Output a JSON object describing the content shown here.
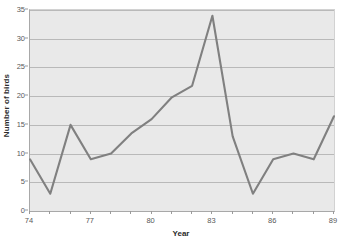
{
  "chart_data": {
    "type": "line",
    "title": "",
    "xlabel": "Year",
    "ylabel": "Number of birds",
    "x": [
      74,
      75,
      76,
      77,
      78,
      79,
      80,
      81,
      82,
      83,
      84,
      85,
      86,
      87,
      88,
      89
    ],
    "values": [
      9,
      3,
      15,
      9,
      10,
      13.5,
      16,
      19.8,
      21.8,
      34,
      13,
      3,
      9,
      10,
      9,
      16.5
    ],
    "series": [
      {
        "name": "Number of birds",
        "values": [
          9,
          3,
          15,
          9,
          10,
          13.5,
          16,
          19.8,
          21.8,
          34,
          13,
          3,
          9,
          10,
          9,
          16.5
        ]
      }
    ],
    "xlim": [
      74,
      89
    ],
    "ylim": [
      0,
      35
    ],
    "ytick_values": [
      0,
      5,
      10,
      15,
      20,
      25,
      30,
      35
    ],
    "ytick_labels": [
      "0",
      "5",
      "10",
      "15",
      "20",
      "25",
      "30",
      "35"
    ],
    "xtick_values": [
      74,
      75,
      76,
      77,
      78,
      79,
      80,
      81,
      82,
      83,
      84,
      85,
      86,
      87,
      88,
      89
    ],
    "xtick_labels_shown": [
      {
        "value": 74,
        "label": "74"
      },
      {
        "value": 77,
        "label": "77"
      },
      {
        "value": 80,
        "label": "80"
      },
      {
        "value": 83,
        "label": "83"
      },
      {
        "value": 86,
        "label": "86"
      },
      {
        "value": 89,
        "label": "89"
      }
    ],
    "grid": true,
    "legend": false,
    "line_color": "#808080",
    "plot_background": "#e9e9e9",
    "gridline_color": "#b9b9b9",
    "axis_color": "#a8a8a8",
    "tick_label_color": "#595959",
    "axis_title_color": "#2b2b2b"
  }
}
